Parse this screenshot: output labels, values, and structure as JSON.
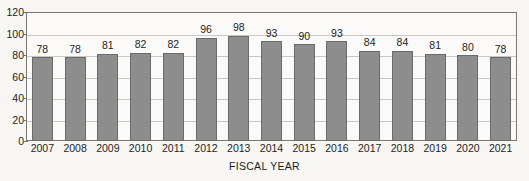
{
  "chart_data": {
    "type": "bar",
    "title": "",
    "xlabel": "FISCAL YEAR",
    "ylabel": "",
    "categories": [
      "2007",
      "2008",
      "2009",
      "2010",
      "2011",
      "2012",
      "2013",
      "2014",
      "2015",
      "2016",
      "2017",
      "2018",
      "2019",
      "2020",
      "2021"
    ],
    "values": [
      78,
      78,
      81,
      82,
      82,
      96,
      98,
      93,
      90,
      93,
      84,
      84,
      81,
      80,
      78
    ],
    "ylim": [
      0,
      120
    ],
    "ytick_labels": [
      "0",
      "20",
      "40",
      "60",
      "80",
      "100",
      "120"
    ],
    "ytick_values": [
      0,
      20,
      40,
      60,
      80,
      100,
      120
    ],
    "grid": true,
    "legend": "none",
    "show_data_labels": true,
    "bar_color": "#8d8d8d",
    "bar_border_color": "#6a6a6a",
    "gridline_color": "#c9c7c2",
    "frame_color": "#777777",
    "background_color": "#f7f6f3",
    "text_color": "#1d1d1d"
  }
}
